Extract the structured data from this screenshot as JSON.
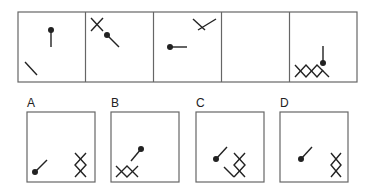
{
  "puzzle": {
    "sequence_cells": 5,
    "options": [
      {
        "label": "A"
      },
      {
        "label": "B"
      },
      {
        "label": "C"
      },
      {
        "label": "D"
      }
    ]
  },
  "colors": {
    "stroke": "#555555",
    "figure": "#222222"
  }
}
